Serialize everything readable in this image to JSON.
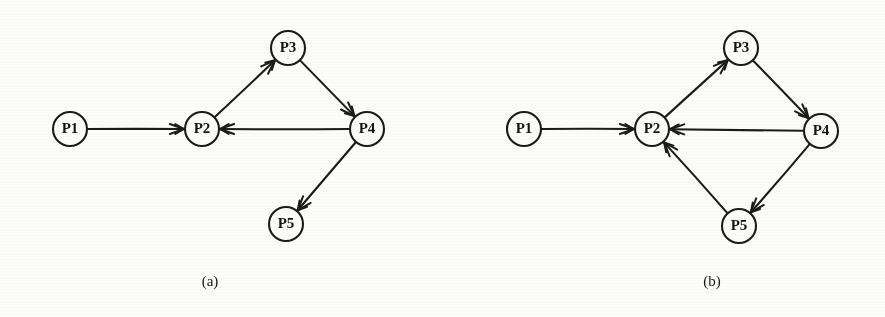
{
  "figure": {
    "background_color": "#fdfdfb",
    "ink_color": "#1b1b1b",
    "node_radius": 17,
    "node_label_color": "#141414"
  },
  "panels": [
    {
      "id": "panel-a",
      "caption": "(a)",
      "caption_pos": {
        "x": 210,
        "y": 283
      },
      "nodes": [
        {
          "id": "P1",
          "label": "P1",
          "x": 70,
          "y": 129
        },
        {
          "id": "P2",
          "label": "P2",
          "x": 202,
          "y": 129
        },
        {
          "id": "P3",
          "label": "P3",
          "x": 288,
          "y": 48
        },
        {
          "id": "P4",
          "label": "P4",
          "x": 367,
          "y": 129
        },
        {
          "id": "P5",
          "label": "P5",
          "x": 286,
          "y": 224
        }
      ],
      "edges": [
        {
          "from": "P1",
          "to": "P2",
          "label": ""
        },
        {
          "from": "P2",
          "to": "P3",
          "label": ""
        },
        {
          "from": "P3",
          "to": "P4",
          "label": ""
        },
        {
          "from": "P4",
          "to": "P2",
          "label": ""
        },
        {
          "from": "P4",
          "to": "P5",
          "label": ""
        }
      ]
    },
    {
      "id": "panel-b",
      "caption": "(b)",
      "caption_pos": {
        "x": 712,
        "y": 283
      },
      "nodes": [
        {
          "id": "P1",
          "label": "P1",
          "x": 524,
          "y": 129
        },
        {
          "id": "P2",
          "label": "P2",
          "x": 652,
          "y": 129
        },
        {
          "id": "P3",
          "label": "P3",
          "x": 741,
          "y": 48
        },
        {
          "id": "P4",
          "label": "P4",
          "x": 821,
          "y": 131
        },
        {
          "id": "P5",
          "label": "P5",
          "x": 739,
          "y": 226
        }
      ],
      "edges": [
        {
          "from": "P1",
          "to": "P2",
          "label": ""
        },
        {
          "from": "P2",
          "to": "P3",
          "label": ""
        },
        {
          "from": "P3",
          "to": "P4",
          "label": ""
        },
        {
          "from": "P4",
          "to": "P2",
          "label": ""
        },
        {
          "from": "P4",
          "to": "P5",
          "label": ""
        },
        {
          "from": "P5",
          "to": "P2",
          "label": ""
        }
      ]
    }
  ]
}
